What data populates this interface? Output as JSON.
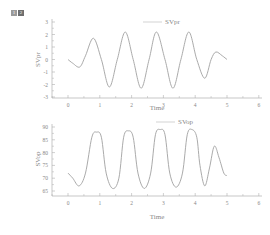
{
  "toolbar": {
    "layer_icons": [
      {
        "label": "1",
        "color": "#9a9a9a"
      },
      {
        "label": "2",
        "color": "#6e6e6e"
      }
    ]
  },
  "colors": {
    "line": "#a0a0a0",
    "axis": "#b0b0b0",
    "text": "#888888"
  },
  "chart_data": [
    {
      "type": "line",
      "title": "",
      "xlabel": "Time",
      "ylabel": "SVpr",
      "xlim": [
        -0.5,
        6
      ],
      "ylim": [
        -3,
        3
      ],
      "xticks": [
        "0",
        "1",
        "2",
        "3",
        "4",
        "5",
        "6"
      ],
      "yticks": [
        "3",
        "2",
        "1",
        "0",
        "-1",
        "-2",
        "-3"
      ],
      "legend": {
        "position": "top-right",
        "entries": [
          "SVpr"
        ]
      },
      "grid": false,
      "series": [
        {
          "name": "SVpr",
          "x": [
            0,
            0.15,
            0.37,
            0.55,
            0.8,
            1.05,
            1.3,
            1.55,
            1.8,
            2.05,
            2.3,
            2.55,
            2.78,
            3.05,
            3.3,
            3.55,
            3.8,
            4.05,
            4.3,
            4.5,
            4.65,
            4.85,
            5.0
          ],
          "y": [
            0,
            -0.3,
            -0.6,
            0.3,
            1.7,
            0,
            -2.2,
            0,
            2.2,
            0,
            -2.3,
            0,
            2.2,
            0,
            -2.3,
            0,
            2.2,
            0,
            -1.5,
            0,
            0.6,
            0.3,
            0
          ]
        }
      ]
    },
    {
      "type": "line",
      "title": "",
      "xlabel": "Time",
      "ylabel": "SVop",
      "xlim": [
        -0.5,
        6
      ],
      "ylim": [
        63,
        92
      ],
      "xticks": [
        "0",
        "1",
        "2",
        "3",
        "4",
        "5",
        "6"
      ],
      "yticks": [
        "90",
        "85",
        "80",
        "75",
        "70",
        "65"
      ],
      "legend": {
        "position": "top-right",
        "entries": [
          "SVop"
        ]
      },
      "grid": false,
      "series": [
        {
          "name": "SVop",
          "x": [
            0,
            0.15,
            0.35,
            0.55,
            0.75,
            0.9,
            1.05,
            1.2,
            1.4,
            1.6,
            1.75,
            1.9,
            2.05,
            2.2,
            2.4,
            2.6,
            2.75,
            2.9,
            3.05,
            3.2,
            3.4,
            3.6,
            3.75,
            3.9,
            4.05,
            4.15,
            4.3,
            4.45,
            4.6,
            4.75,
            4.9,
            5.0
          ],
          "y": [
            72,
            70,
            67,
            72,
            86,
            88,
            86,
            72,
            66,
            70,
            86,
            88.5,
            86,
            72,
            66,
            72,
            87,
            89,
            87,
            72,
            66.5,
            72,
            87,
            89,
            86,
            75,
            67,
            74,
            82.5,
            78,
            72,
            71
          ]
        }
      ]
    }
  ]
}
